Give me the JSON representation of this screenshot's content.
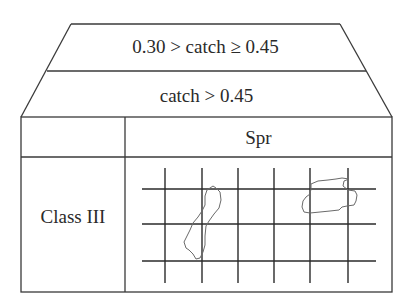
{
  "header_rows": [
    {
      "label": "0.30 > catch ≥ 0.45"
    },
    {
      "label": "catch > 0.45"
    }
  ],
  "table": {
    "column_header": "Spr",
    "row_header": "Class III"
  },
  "grid": {
    "vertical_lines_x": [
      165,
      202,
      238,
      274,
      310,
      348
    ],
    "horizontal_lines_y": [
      189,
      224,
      261
    ]
  },
  "colors": {
    "line": "#3a3a3a",
    "blob_outline": "#6a6a6a",
    "background": "#ffffff"
  }
}
